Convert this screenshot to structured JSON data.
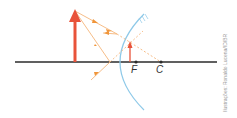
{
  "diagram": {
    "type": "convex-mirror-ray-diagram",
    "labels": {
      "focus": "F",
      "center": "C"
    },
    "credit": "Ilustrações: Ronaldo Lucena/ID/BR",
    "colors": {
      "axis": "#2b2b2b",
      "mirror": "#8ec9e8",
      "object": "#e8533a",
      "rays": "#f5b57a",
      "ray_arrows": "#f0953a"
    }
  }
}
